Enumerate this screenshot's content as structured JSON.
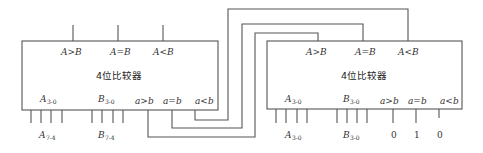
{
  "diagram": {
    "type": "cascaded 4-bit comparators",
    "left_chip": {
      "title": "4位比较器",
      "outputs": [
        "A>B",
        "A=B",
        "A<B"
      ],
      "input_a": {
        "label": "A",
        "sub": "3-0"
      },
      "input_b": {
        "label": "B",
        "sub": "3-0"
      },
      "input_a_ext": {
        "label": "A",
        "sub": "7-4"
      },
      "input_b_ext": {
        "label": "B",
        "sub": "7-4"
      },
      "cascade_inputs": [
        "a>b",
        "a=b",
        "a<b"
      ]
    },
    "right_chip": {
      "title": "4位比较器",
      "outputs": [
        "A>B",
        "A=B",
        "A<B"
      ],
      "input_a": {
        "label": "A",
        "sub": "3-0"
      },
      "input_b": {
        "label": "B",
        "sub": "3-0"
      },
      "input_a_ext": {
        "label": "A",
        "sub": "3-0"
      },
      "input_b_ext": {
        "label": "B",
        "sub": "3-0"
      },
      "cascade_inputs": [
        "a>b",
        "a=b",
        "a<b"
      ],
      "cascade_values": [
        "0",
        "1",
        "0"
      ]
    },
    "connections": [
      {
        "from": "left.a<b",
        "to": "right.A<B"
      },
      {
        "from": "left.a=b",
        "to": "right.A=B"
      },
      {
        "from": "left.a>b",
        "to": "right.A>B"
      }
    ],
    "colors": {
      "line": "#555555",
      "text": "#333333"
    }
  }
}
